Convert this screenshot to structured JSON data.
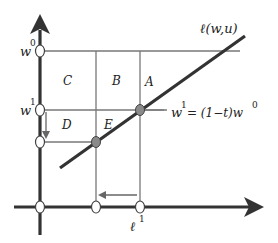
{
  "diagram": {
    "type": "economics-wage-labor-diagram",
    "axes": {
      "vertical_axis": "wage",
      "horizontal_axis": "labor"
    },
    "curve_label": "ℓ(w,u)",
    "y_ticks": [
      {
        "base": "w",
        "sup": "0"
      },
      {
        "base": "w",
        "sup": "1"
      }
    ],
    "x_ticks": [
      {
        "base": "ℓ",
        "sup": "1"
      }
    ],
    "equation": {
      "lhs_base": "w",
      "lhs_sup": "1",
      "rhs": "= (1−t)w",
      "rhs_sup": "0"
    },
    "regions": [
      "A",
      "B",
      "C",
      "D",
      "E"
    ],
    "colors": {
      "axis": "#333333",
      "grid": "#777777",
      "curve": "#333333",
      "filled_point": "#8a8a8a",
      "open_point_fill": "#ffffff"
    }
  }
}
